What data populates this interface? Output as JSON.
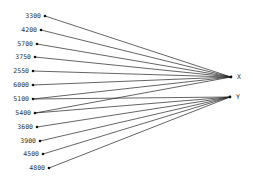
{
  "diagram": {
    "type": "bipartite-graph",
    "targets": [
      {
        "id": "X",
        "label": "X",
        "x": 231,
        "y": 77
      },
      {
        "id": "Y",
        "label": "Y",
        "x": 230,
        "y": 97
      }
    ],
    "sources": [
      {
        "label": "3300",
        "x": 45,
        "y": 16,
        "connects": [
          "X"
        ]
      },
      {
        "label": "4200",
        "x": 41,
        "y": 30,
        "connects": [
          "X"
        ]
      },
      {
        "label": "5700",
        "x": 37,
        "y": 44,
        "connects": [
          "X"
        ]
      },
      {
        "label": "3750",
        "x": 35,
        "y": 57,
        "connects": [
          "X"
        ]
      },
      {
        "label": "2550",
        "x": 33,
        "y": 71,
        "connects": [
          "X"
        ]
      },
      {
        "label": "6000",
        "x": 33,
        "y": 85,
        "connects": [
          "X"
        ]
      },
      {
        "label": "5100",
        "x": 33,
        "y": 99,
        "connects": [
          "X",
          "Y"
        ]
      },
      {
        "label": "5400",
        "x": 35,
        "y": 113,
        "connects": [
          "X",
          "Y"
        ]
      },
      {
        "label": "3600",
        "x": 37,
        "y": 127,
        "connects": [
          "Y"
        ]
      },
      {
        "label": "3900",
        "x": 40,
        "y": 141,
        "connects": [
          "Y"
        ]
      },
      {
        "label": "4500",
        "x": 43,
        "y": 154,
        "connects": [
          "Y"
        ]
      },
      {
        "label": "4800",
        "x": 49,
        "y": 168,
        "connects": [
          "Y"
        ]
      }
    ],
    "colors": {
      "line": "#222222",
      "node": "#111111",
      "text": "#333333",
      "background": "#ffffff"
    }
  }
}
